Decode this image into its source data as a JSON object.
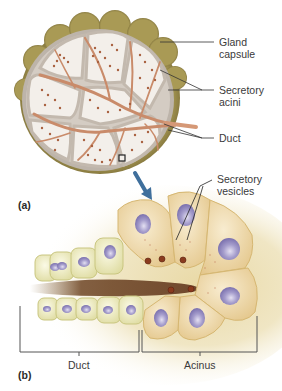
{
  "figure": {
    "panel_a": {
      "label": "(a)",
      "callouts": [
        {
          "id": "gland-capsule",
          "line1": "Gland",
          "line2": "capsule"
        },
        {
          "id": "secretory-acini",
          "line1": "Secretory",
          "line2": "acini"
        },
        {
          "id": "duct",
          "line1": "Duct",
          "line2": ""
        }
      ]
    },
    "panel_b": {
      "label": "(b)",
      "callouts": [
        {
          "id": "secretory-vesicles",
          "line1": "Secretory",
          "line2": "vesicles"
        }
      ],
      "brackets": [
        {
          "id": "duct",
          "label": "Duct"
        },
        {
          "id": "acinus",
          "label": "Acinus"
        }
      ]
    },
    "colors": {
      "capsule": "#8c7d3e",
      "lobule_border": "#bdb4aa",
      "lobule_fill": "#f3efea",
      "duct": "#c98b6a",
      "acini": "#a8613f",
      "cell_fill": "#f2ddb0",
      "nucleus": "#8f86bf",
      "duct_cell": "#f1efc8",
      "lumen": "#6b4222",
      "arrow": "#3f6f9c",
      "leader": "#333333"
    }
  }
}
